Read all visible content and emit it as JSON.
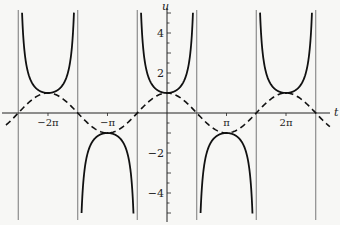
{
  "chart_data": {
    "type": "line",
    "title": "",
    "xlabel": "t",
    "ylabel": "u",
    "xlim": [
      -8.65,
      9.0
    ],
    "ylim": [
      -5.5,
      5.5
    ],
    "x_ticks": [
      {
        "value": -6.2832,
        "label": "−2π"
      },
      {
        "value": -3.1416,
        "label": "−π"
      },
      {
        "value": 3.1416,
        "label": "π"
      },
      {
        "value": 6.2832,
        "label": "2π"
      }
    ],
    "y_ticks": [
      {
        "value": 4,
        "label": "4"
      },
      {
        "value": 2,
        "label": "2"
      },
      {
        "value": -2,
        "label": "−2"
      },
      {
        "value": -4,
        "label": "−4"
      }
    ],
    "asymptotes_x": [
      -7.854,
      -4.712,
      -1.571,
      1.571,
      4.712,
      7.854
    ],
    "series": [
      {
        "name": "u = sec t",
        "style": "solid",
        "function": "1/cos(t)",
        "color": "#111111"
      },
      {
        "name": "u = cos t",
        "style": "dashed",
        "function": "cos(t)",
        "color": "#111111"
      }
    ],
    "grid": false,
    "legend": null
  }
}
